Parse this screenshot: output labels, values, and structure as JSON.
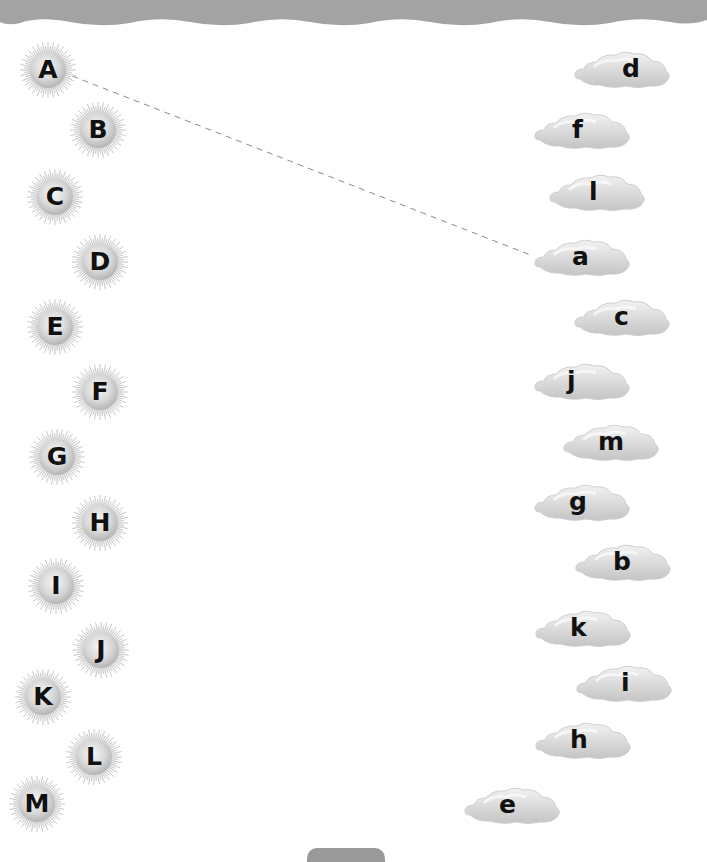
{
  "worksheet": {
    "type": "letter-matching",
    "colors": {
      "header_band": "#a3a3a3",
      "sun_fill": "#d4d4d4",
      "cloud_fill": "#d9d9d9",
      "connector_line": "#8a8a8a",
      "letter": "#111111"
    },
    "uppercase_suns": [
      {
        "letter": "A",
        "x": 48,
        "y": 70
      },
      {
        "letter": "B",
        "x": 98,
        "y": 130
      },
      {
        "letter": "C",
        "x": 55,
        "y": 197
      },
      {
        "letter": "D",
        "x": 100,
        "y": 262
      },
      {
        "letter": "E",
        "x": 55,
        "y": 327
      },
      {
        "letter": "F",
        "x": 100,
        "y": 392
      },
      {
        "letter": "G",
        "x": 57,
        "y": 457
      },
      {
        "letter": "H",
        "x": 100,
        "y": 523
      },
      {
        "letter": "I",
        "x": 56,
        "y": 586
      },
      {
        "letter": "J",
        "x": 101,
        "y": 650
      },
      {
        "letter": "K",
        "x": 43,
        "y": 697
      },
      {
        "letter": "L",
        "x": 94,
        "y": 757
      },
      {
        "letter": "M",
        "x": 37,
        "y": 804
      }
    ],
    "lowercase_clouds": [
      {
        "letter": "d",
        "x": 622,
        "y": 70,
        "text_offset": 58
      },
      {
        "letter": "f",
        "x": 582,
        "y": 131,
        "text_offset": 48
      },
      {
        "letter": "l",
        "x": 597,
        "y": 193,
        "text_offset": 50
      },
      {
        "letter": "a",
        "x": 582,
        "y": 258,
        "text_offset": 48
      },
      {
        "letter": "c",
        "x": 622,
        "y": 318,
        "text_offset": 50
      },
      {
        "letter": "j",
        "x": 582,
        "y": 382,
        "text_offset": 43
      },
      {
        "letter": "m",
        "x": 611,
        "y": 443,
        "text_offset": 45
      },
      {
        "letter": "g",
        "x": 582,
        "y": 503,
        "text_offset": 45
      },
      {
        "letter": "b",
        "x": 623,
        "y": 563,
        "text_offset": 48
      },
      {
        "letter": "k",
        "x": 583,
        "y": 629,
        "text_offset": 45
      },
      {
        "letter": "i",
        "x": 624,
        "y": 684,
        "text_offset": 55
      },
      {
        "letter": "h",
        "x": 583,
        "y": 741,
        "text_offset": 45
      },
      {
        "letter": "e",
        "x": 512,
        "y": 806,
        "text_offset": 45
      }
    ],
    "completed_matches": [
      {
        "from": "A",
        "to": "a",
        "x1": 62,
        "y1": 72,
        "x2": 533,
        "y2": 256,
        "style": "dashed"
      }
    ]
  }
}
